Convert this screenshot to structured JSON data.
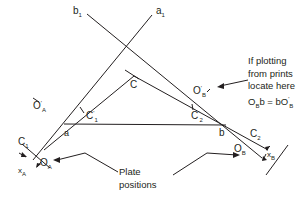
{
  "diagram": {
    "type": "radial-line plotting / plate positions",
    "colors": {
      "line": "#231f20",
      "background": "#ffffff"
    },
    "labels": {
      "b1": {
        "base": "b",
        "sub": "1"
      },
      "a1": {
        "base": "a",
        "sub": "1"
      },
      "C": "C",
      "a": "a",
      "b": "b",
      "OA_prime": {
        "base": "O",
        "sub": "A",
        "sup": "'"
      },
      "OB_prime": {
        "base": "O",
        "sub": "B",
        "sup": "'"
      },
      "C1_prime": {
        "base": "C",
        "sub": "1",
        "sup": "'"
      },
      "C2_prime": {
        "base": "C",
        "sub": "2",
        "sup": "'"
      },
      "C1": {
        "base": "C",
        "sub": "1"
      },
      "C2": {
        "base": "C",
        "sub": "2"
      },
      "OA": {
        "base": "O",
        "sub": "A"
      },
      "OB": {
        "base": "O",
        "sub": "B"
      },
      "xA": {
        "base": "x",
        "sub": "A"
      },
      "xB": {
        "base": "x",
        "sub": "B"
      }
    },
    "note": {
      "lines": [
        "If plotting",
        "from prints",
        "locate here"
      ],
      "formula": {
        "left": "O",
        "left_sub": "B",
        "mid": "b = bO",
        "right_sub": "B",
        "right_sup": "'"
      }
    },
    "plate_label": {
      "line1": "Plate",
      "line2": "positions"
    }
  }
}
